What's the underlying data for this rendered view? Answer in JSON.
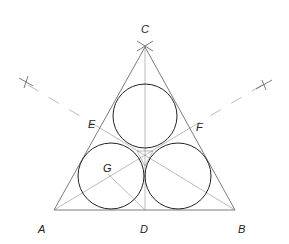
{
  "figure": {
    "labels": {
      "A": "A",
      "B": "B",
      "C": "C",
      "D": "D",
      "E": "E",
      "F": "F",
      "G": "G"
    },
    "colors": {
      "stroke": "#222222",
      "background": "#ffffff"
    }
  }
}
